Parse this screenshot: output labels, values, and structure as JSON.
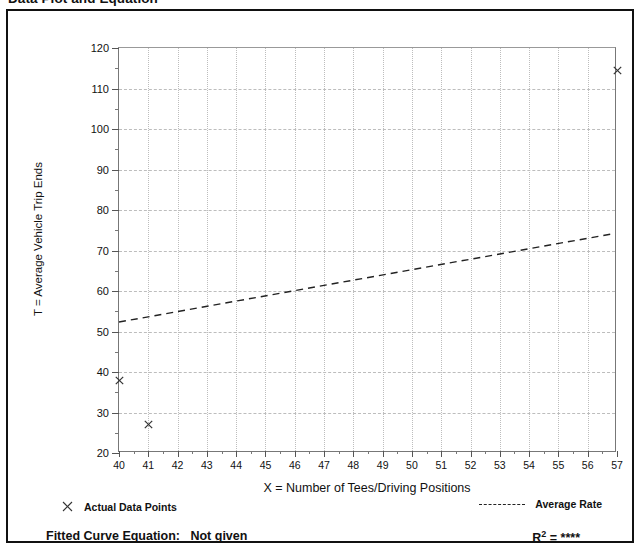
{
  "page": {
    "title": "Data Plot and Equation"
  },
  "legend": {
    "points_marker": "x-mark-icon",
    "points_label": "Actual Data Points",
    "rate_marker": "dashed-line-icon",
    "rate_label": "Average Rate"
  },
  "footer": {
    "fitted_equation_label": "Fitted Curve Equation:",
    "fitted_equation_value": "Not given",
    "r_squared_label": "R",
    "r_squared_exponent": "2",
    "r_squared_value": "= ****"
  },
  "chart_data": {
    "type": "scatter",
    "title": "Data Plot and Equation",
    "xlabel": "X = Number of Tees/Driving Positions",
    "ylabel": "T = Average Vehicle Trip Ends",
    "xlim": [
      40,
      57
    ],
    "ylim": [
      20,
      120
    ],
    "xticks": [
      40,
      41,
      42,
      43,
      44,
      45,
      46,
      47,
      48,
      49,
      50,
      51,
      52,
      53,
      54,
      55,
      56,
      57
    ],
    "yticks": [
      20,
      30,
      40,
      50,
      60,
      70,
      80,
      90,
      100,
      110,
      120
    ],
    "y_minor_ticks": [
      25,
      35,
      45,
      55,
      65,
      75,
      85,
      95,
      105,
      115
    ],
    "grid": true,
    "grid_style": {
      "vertical": "dotted",
      "horizontal": "dashed",
      "color": "#bdbdbd"
    },
    "legend_position": "below-axes",
    "series": [
      {
        "name": "Actual Data Points",
        "type": "scatter",
        "marker": "x",
        "color": "#333333",
        "points": [
          {
            "x": 40,
            "y": 38
          },
          {
            "x": 41,
            "y": 27
          },
          {
            "x": 57,
            "y": 114.5
          }
        ]
      },
      {
        "name": "Average Rate",
        "type": "line",
        "style": "dashed",
        "color": "#222222",
        "points": [
          {
            "x": 40,
            "y": 52
          },
          {
            "x": 57,
            "y": 74
          }
        ]
      }
    ]
  }
}
